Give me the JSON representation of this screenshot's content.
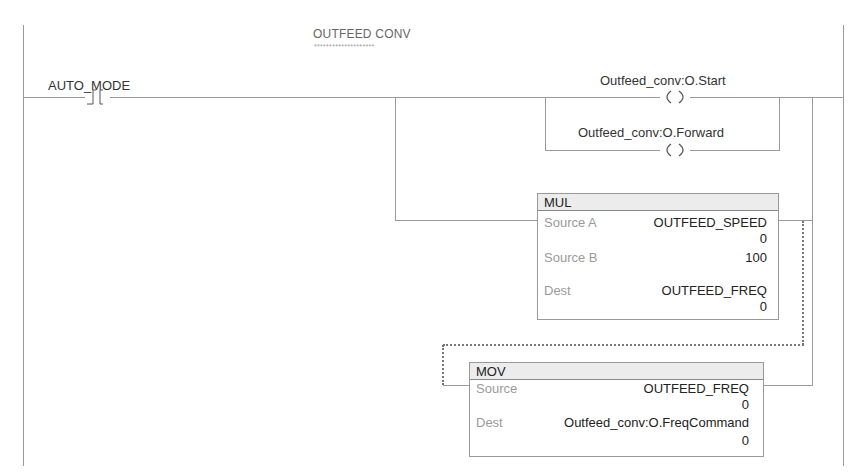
{
  "rung": {
    "comment": "OUTFEED CONV",
    "comment_underline": "********************"
  },
  "contact": {
    "tag": "AUTO_MODE",
    "type": "XIC"
  },
  "coils": [
    {
      "tag": "Outfeed_conv:O.Start",
      "type": "OTE"
    },
    {
      "tag": "Outfeed_conv:O.Forward",
      "type": "OTE"
    }
  ],
  "mul": {
    "name": "MUL",
    "rows": [
      {
        "label": "Source A",
        "tag": "OUTFEED_SPEED",
        "value": "0"
      },
      {
        "label": "Source B",
        "tag": "",
        "value": "100"
      },
      {
        "label": "Dest",
        "tag": "OUTFEED_FREQ",
        "value": "0"
      }
    ]
  },
  "mov": {
    "name": "MOV",
    "rows": [
      {
        "label": "Source",
        "tag": "OUTFEED_FREQ",
        "value": "0"
      },
      {
        "label": "Dest",
        "tag": "Outfeed_conv:O.FreqCommand",
        "value": "0"
      }
    ]
  },
  "colors": {
    "wire": "#9a9a9a",
    "header_bg": "#ececec",
    "param_label": "#9a9a9a"
  }
}
